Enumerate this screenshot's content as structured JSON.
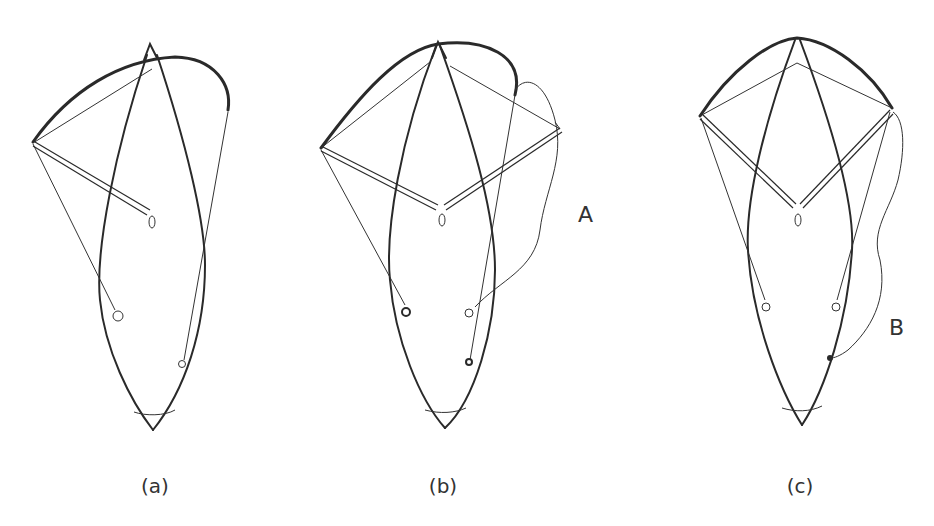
{
  "figure": {
    "panels": [
      {
        "id": "a",
        "caption": "(a)",
        "annotation": ""
      },
      {
        "id": "b",
        "caption": "(b)",
        "annotation": "A"
      },
      {
        "id": "c",
        "caption": "(c)",
        "annotation": "B"
      }
    ]
  },
  "colors": {
    "ink": "#2a2a2a",
    "background": "#ffffff"
  }
}
